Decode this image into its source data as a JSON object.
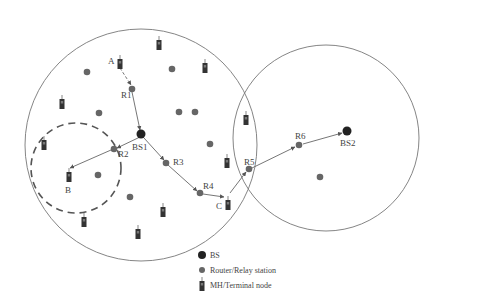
{
  "diagram": {
    "cells": [
      {
        "id": "cell-bs1",
        "cx": 141,
        "cy": 145,
        "r": 116
      },
      {
        "id": "cell-bs2",
        "cx": 326,
        "cy": 138,
        "r": 93
      }
    ],
    "dashed_cell": {
      "cx": 76,
      "cy": 168,
      "r": 45
    },
    "base_stations": [
      {
        "label": "BS1",
        "x": 141,
        "y": 134,
        "lx": 132,
        "ly": 150
      },
      {
        "label": "BS2",
        "x": 347,
        "y": 131,
        "lx": 340,
        "ly": 146
      }
    ],
    "relays": [
      {
        "label": "R1",
        "x": 132,
        "y": 89,
        "lx": 121,
        "ly": 98
      },
      {
        "label": "R2",
        "x": 114,
        "y": 149,
        "lx": 118,
        "ly": 157
      },
      {
        "label": "R3",
        "x": 166,
        "y": 163,
        "lx": 173,
        "ly": 165
      },
      {
        "label": "R4",
        "x": 200,
        "y": 193,
        "lx": 203,
        "ly": 189
      },
      {
        "label": "R5",
        "x": 249,
        "y": 169,
        "lx": 244,
        "ly": 165
      },
      {
        "label": "R6",
        "x": 299,
        "y": 145,
        "lx": 295,
        "ly": 139
      },
      {
        "label": "",
        "x": 87,
        "y": 72
      },
      {
        "label": "",
        "x": 172,
        "y": 69
      },
      {
        "label": "",
        "x": 99,
        "y": 113
      },
      {
        "label": "",
        "x": 179,
        "y": 112
      },
      {
        "label": "",
        "x": 195,
        "y": 112
      },
      {
        "label": "",
        "x": 210,
        "y": 144
      },
      {
        "label": "",
        "x": 98,
        "y": 175
      },
      {
        "label": "",
        "x": 130,
        "y": 197
      },
      {
        "label": "",
        "x": 320,
        "y": 177
      }
    ],
    "terminals": [
      {
        "label": "A",
        "x": 120,
        "y": 64,
        "lx": 108,
        "ly": 64
      },
      {
        "label": "B",
        "x": 69,
        "y": 177,
        "lx": 65,
        "ly": 193
      },
      {
        "label": "C",
        "x": 228,
        "y": 205,
        "lx": 216,
        "ly": 209
      },
      {
        "label": "",
        "x": 159,
        "y": 45
      },
      {
        "label": "",
        "x": 205,
        "y": 68
      },
      {
        "label": "",
        "x": 62,
        "y": 104
      },
      {
        "label": "",
        "x": 44,
        "y": 145
      },
      {
        "label": "",
        "x": 227,
        "y": 163
      },
      {
        "label": "",
        "x": 246,
        "y": 120
      },
      {
        "label": "",
        "x": 163,
        "y": 212
      },
      {
        "label": "",
        "x": 84,
        "y": 222
      },
      {
        "label": "",
        "x": 138,
        "y": 234
      }
    ],
    "links": [
      {
        "from": [
          120,
          68
        ],
        "to": [
          131,
          85
        ],
        "dashed": true
      },
      {
        "from": [
          132,
          92
        ],
        "to": [
          140,
          130
        ],
        "dashed": false
      },
      {
        "from": [
          140,
          137
        ],
        "to": [
          117,
          148
        ],
        "dashed": false
      },
      {
        "from": [
          111,
          150
        ],
        "to": [
          70,
          168
        ],
        "dashed": false
      },
      {
        "from": [
          144,
          138
        ],
        "to": [
          164,
          160
        ],
        "dashed": false
      },
      {
        "from": [
          168,
          165
        ],
        "to": [
          197,
          191
        ],
        "dashed": false
      },
      {
        "from": [
          203,
          194
        ],
        "to": [
          224,
          197
        ],
        "dashed": false
      },
      {
        "from": [
          230,
          193
        ],
        "to": [
          246,
          172
        ],
        "dashed": false
      },
      {
        "from": [
          252,
          168
        ],
        "to": [
          295,
          147
        ],
        "dashed": false
      },
      {
        "from": [
          303,
          144
        ],
        "to": [
          342,
          133
        ],
        "dashed": false
      }
    ]
  },
  "legend": {
    "items": [
      {
        "symbol": "bs",
        "label": "BS"
      },
      {
        "symbol": "relay",
        "label": "Router/Relay station"
      },
      {
        "symbol": "terminal",
        "label": "MH/Terminal node"
      }
    ]
  },
  "colors": {
    "stroke": "#777777",
    "node": "#666666",
    "bs": "#222222",
    "terminal": "#333333",
    "text": "#444444"
  }
}
